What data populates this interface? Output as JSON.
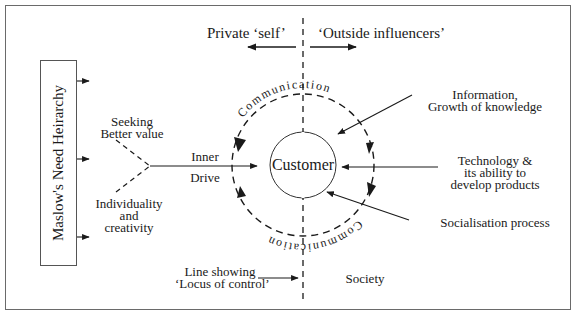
{
  "diagram": {
    "center_label": "Customer",
    "left_box_label": "Maslow's Need Heirarchy",
    "top_left_label": "Private ‘self’",
    "top_right_label": "‘Outside influencers’",
    "ring_label_top": "Communication",
    "ring_label_bottom": "Communication",
    "inner_drive": {
      "line1": "Inner",
      "line2": "Drive"
    },
    "seeking": {
      "line1": "Seeking",
      "line2": "Better value"
    },
    "individuality": {
      "line1": "Individuality",
      "line2": "and",
      "line3": "creativity"
    },
    "influencers": [
      {
        "line1": "Information,",
        "line2": "Growth of knowledge"
      },
      {
        "line1": "Technology &",
        "line2": "its ability to",
        "line3": "develop products"
      },
      {
        "line1": "Socialisation process"
      }
    ],
    "locus": {
      "line1": "Line showing",
      "line2": "‘Locus of control’"
    },
    "society_label": "Society",
    "colors": {
      "line": "#1a1a1a",
      "frame": "#6a6a6a",
      "background": "#ffffff"
    }
  }
}
